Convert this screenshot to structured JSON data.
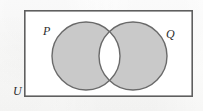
{
  "figure": {
    "kind": "venn-diagram"
  },
  "labels": {
    "set_left": "P",
    "set_right": "Q",
    "universal_set": "U"
  },
  "colors": {
    "circle_fill": "#c9c9c9",
    "circle_stroke": "#6a6a6a",
    "intersection_fill": "#ffffff",
    "rectangle_stroke": "#5f5f5f",
    "rectangle_fill": "#ffffff",
    "page_background": "#fdfdfc",
    "label_color": "#2d2d2d"
  },
  "geometry": {
    "canvas": {
      "width": 203,
      "height": 111
    },
    "rectangle": {
      "x": 24,
      "y": 10,
      "width": 169,
      "height": 87,
      "stroke_width": 1.6
    },
    "circle_left": {
      "cx": 86,
      "cy": 56,
      "r": 34,
      "stroke_width": 1.4
    },
    "circle_right": {
      "cx": 133,
      "cy": 56,
      "r": 34,
      "stroke_width": 1.4
    }
  },
  "shaded_regions": [
    "P only",
    "Q only"
  ],
  "unshaded_regions": [
    "P intersect Q",
    "outside both circles within U"
  ]
}
